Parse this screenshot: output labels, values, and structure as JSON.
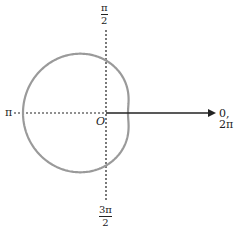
{
  "diagram": {
    "type": "polar-graph",
    "curve": {
      "description": "dimpled limacon r = a - b cos(theta)",
      "a": 52.5,
      "b": 30.5,
      "color": "#9a9a9a"
    },
    "axes": {
      "origin_label": "O",
      "polar_axis_label": "0, 2π",
      "left_label": "π",
      "top_label": {
        "num": "π",
        "den": "2"
      },
      "bottom_label": {
        "num": "3π",
        "den": "2"
      }
    },
    "colors": {
      "axis": "#222222",
      "curve": "#9a9a9a"
    }
  }
}
